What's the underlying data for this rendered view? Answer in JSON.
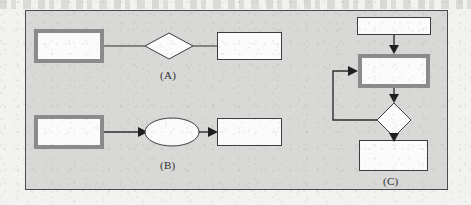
{
  "figure": {
    "type": "flowchart-diagram",
    "background_color": "#f2f2f0",
    "frame_fill": "#d8d8d6",
    "frame_border_color": "#4a4a4a",
    "node_fill": "#fbfbfb",
    "thick_border_color": "#8b8b8b",
    "thin_border_color": "#3d3d3d",
    "line_color": "#2e2e2e"
  },
  "groups": [
    {
      "id": "group-a",
      "label": "(A)",
      "connector_style": "plain-line-no-arrowhead",
      "nodes": [
        {
          "name": "process-thick",
          "shape": "rectangle",
          "border": "thick",
          "text": ""
        },
        {
          "name": "decision",
          "shape": "diamond",
          "border": "thin",
          "text": ""
        },
        {
          "name": "process-thin",
          "shape": "rectangle",
          "border": "thin",
          "text": ""
        }
      ]
    },
    {
      "id": "group-b",
      "label": "(B)",
      "connector_style": "arrow",
      "nodes": [
        {
          "name": "process-thick",
          "shape": "rectangle",
          "border": "thick",
          "text": ""
        },
        {
          "name": "terminator",
          "shape": "ellipse",
          "border": "thin",
          "text": ""
        },
        {
          "name": "process-thin",
          "shape": "rectangle",
          "border": "thin",
          "text": ""
        }
      ]
    },
    {
      "id": "group-c",
      "label": "(C)",
      "connector_style": "arrow",
      "has_feedback_loop": true,
      "nodes": [
        {
          "name": "start-thin",
          "shape": "rectangle",
          "border": "thin",
          "text": ""
        },
        {
          "name": "process-thick",
          "shape": "rectangle",
          "border": "thick",
          "text": ""
        },
        {
          "name": "decision",
          "shape": "diamond",
          "border": "thin",
          "text": ""
        },
        {
          "name": "end-thin",
          "shape": "rectangle",
          "border": "thin",
          "text": ""
        }
      ]
    }
  ],
  "labels": {
    "a": "(A)",
    "b": "(B)",
    "c": "(C)"
  }
}
